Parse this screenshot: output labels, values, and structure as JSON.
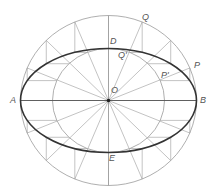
{
  "diagram": {
    "center": {
      "x": 108.5,
      "y": 100.5
    },
    "outer_circle": {
      "rx": 88,
      "ry": 85
    },
    "inner_circle": {
      "rx": 56,
      "ry": 52
    },
    "ellipse": {
      "rx": 88,
      "ry": 52
    },
    "construction_angles_deg": [
      22.5,
      45,
      67.5,
      112.5,
      135,
      157.5,
      202.5,
      225,
      247.5,
      292.5,
      315,
      337.5
    ],
    "ray_angles_deg": [
      0,
      22.5,
      45,
      67.5,
      90,
      112.5,
      135,
      157.5,
      180,
      202.5,
      225,
      247.5,
      270,
      292.5,
      315,
      337.5
    ],
    "colors": {
      "thin_line": "#9a9a9a",
      "ellipse": "#333333",
      "axis": "#555555",
      "label": "#555555",
      "center_dot": "#222222"
    },
    "labels": {
      "A": "A",
      "B": "B",
      "D": "D",
      "E": "E",
      "O": "O",
      "Q": "Q",
      "Q_prime": "Q'",
      "P": "P",
      "P_prime": "P'"
    }
  }
}
